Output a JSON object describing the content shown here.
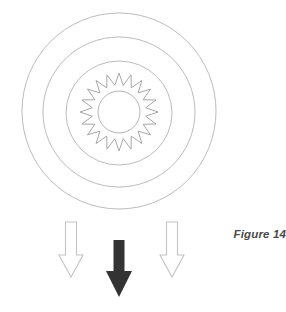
{
  "figure": {
    "caption": "Figure 14",
    "background_color": "#ffffff",
    "ring_stroke_color": "#b9b9b9",
    "star_stroke_color": "#a8a8a8",
    "hollow_arrow_stroke_color": "#c2c2c2",
    "solid_arrow_fill_color": "#333333"
  },
  "chart_data": {
    "type": "diagram",
    "title": "Figure 14",
    "center": {
      "x": 119,
      "y": 111
    },
    "rings": [
      {
        "name": "outer-ring",
        "rx": 97,
        "ry": 98,
        "stroke": "#bcbcbc",
        "stroke_width": 1
      },
      {
        "name": "middle-ring",
        "rx": 76,
        "ry": 75,
        "stroke": "#bcbcbc",
        "stroke_width": 1
      },
      {
        "name": "inner-ring",
        "rx": 53,
        "ry": 52,
        "stroke": "#bcbcbc",
        "stroke_width": 1
      },
      {
        "name": "hub-circle",
        "rx": 21,
        "ry": 21,
        "stroke": "#b5b5b5",
        "stroke_width": 1
      }
    ],
    "star": {
      "name": "serrated-star-ring",
      "points": 20,
      "outer_radius": 39,
      "inner_radius": 27,
      "stroke": "#a8a8a8",
      "stroke_width": 1,
      "fill": "none"
    },
    "arrows": [
      {
        "name": "left-arrow",
        "style": "hollow",
        "direction": "down",
        "x": 71,
        "y_top": 222,
        "y_tip": 277,
        "shaft_width": 11,
        "head_width": 23,
        "stroke": "#c2c2c2",
        "fill": "none"
      },
      {
        "name": "center-arrow",
        "style": "solid",
        "direction": "down",
        "x": 119,
        "y_top": 240,
        "y_tip": 297,
        "shaft_width": 11,
        "head_width": 26,
        "fill": "#333333"
      },
      {
        "name": "right-arrow",
        "style": "hollow",
        "direction": "down",
        "x": 172,
        "y_top": 222,
        "y_tip": 277,
        "shaft_width": 11,
        "head_width": 23,
        "stroke": "#c2c2c2",
        "fill": "none"
      }
    ]
  }
}
